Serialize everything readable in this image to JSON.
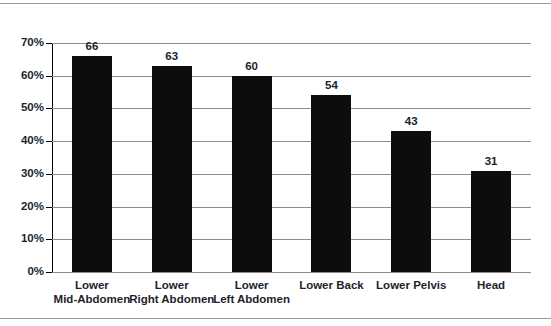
{
  "chart_data": {
    "type": "bar",
    "title": "",
    "subtitle": "",
    "xlabel": "",
    "ylabel": "",
    "orientation": "vertical",
    "grid": true,
    "legend": false,
    "bar_color": "#0d0d0d",
    "ylim": [
      0,
      70
    ],
    "ytick_labels": [
      "0%",
      "10%",
      "20%",
      "30%",
      "40%",
      "50%",
      "60%",
      "70%"
    ],
    "ytick_values": [
      0,
      10,
      20,
      30,
      40,
      50,
      60,
      70
    ],
    "categories": [
      "Lower Mid-Abdomen",
      "Lower Right Abdomen",
      "Lower Left Abdomen",
      "Lower Back",
      "Lower Pelvis",
      "Head"
    ],
    "category_lines": [
      [
        "Lower",
        "Mid-Abdomen"
      ],
      [
        "Lower",
        "Right Abdomen"
      ],
      [
        "Lower",
        "Left Abdomen"
      ],
      [
        "Lower Back"
      ],
      [
        "Lower Pelvis"
      ],
      [
        "Head"
      ]
    ],
    "values": [
      66,
      63,
      60,
      54,
      43,
      31
    ],
    "value_labels": [
      "66",
      "63",
      "60",
      "54",
      "43",
      "31"
    ]
  }
}
